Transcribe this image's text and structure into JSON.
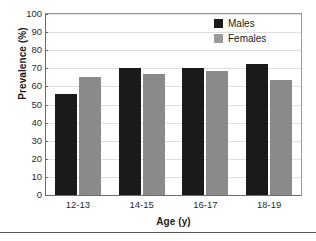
{
  "chart_data": {
    "type": "bar",
    "title": "",
    "xlabel": "Age (y)",
    "ylabel": "Prevalence (%)",
    "categories": [
      "12-13",
      "14-15",
      "16-17",
      "18-19"
    ],
    "series": [
      {
        "name": "Males",
        "color": "#1a1a1a",
        "values": [
          56,
          70,
          70,
          72.5
        ]
      },
      {
        "name": "Females",
        "color": "#8a8a8a",
        "values": [
          65,
          67,
          68.5,
          63.5
        ]
      }
    ],
    "ylim": [
      0,
      100
    ],
    "ytick_labels": [
      "100",
      "90",
      "80",
      "70",
      "60",
      "50",
      "40",
      "30",
      "20",
      "10",
      "0"
    ],
    "ytick_values": [
      100,
      90,
      80,
      70,
      60,
      50,
      40,
      30,
      20,
      10,
      0
    ],
    "grid": "horizontal",
    "legend_position": "top-right-inside"
  },
  "axes": {
    "y_title": "Prevalence (%)",
    "x_title": "Age (y)"
  },
  "legend": {
    "entries": [
      {
        "label": "Males",
        "swatch": "males"
      },
      {
        "label": "Females",
        "swatch": "females"
      }
    ]
  }
}
